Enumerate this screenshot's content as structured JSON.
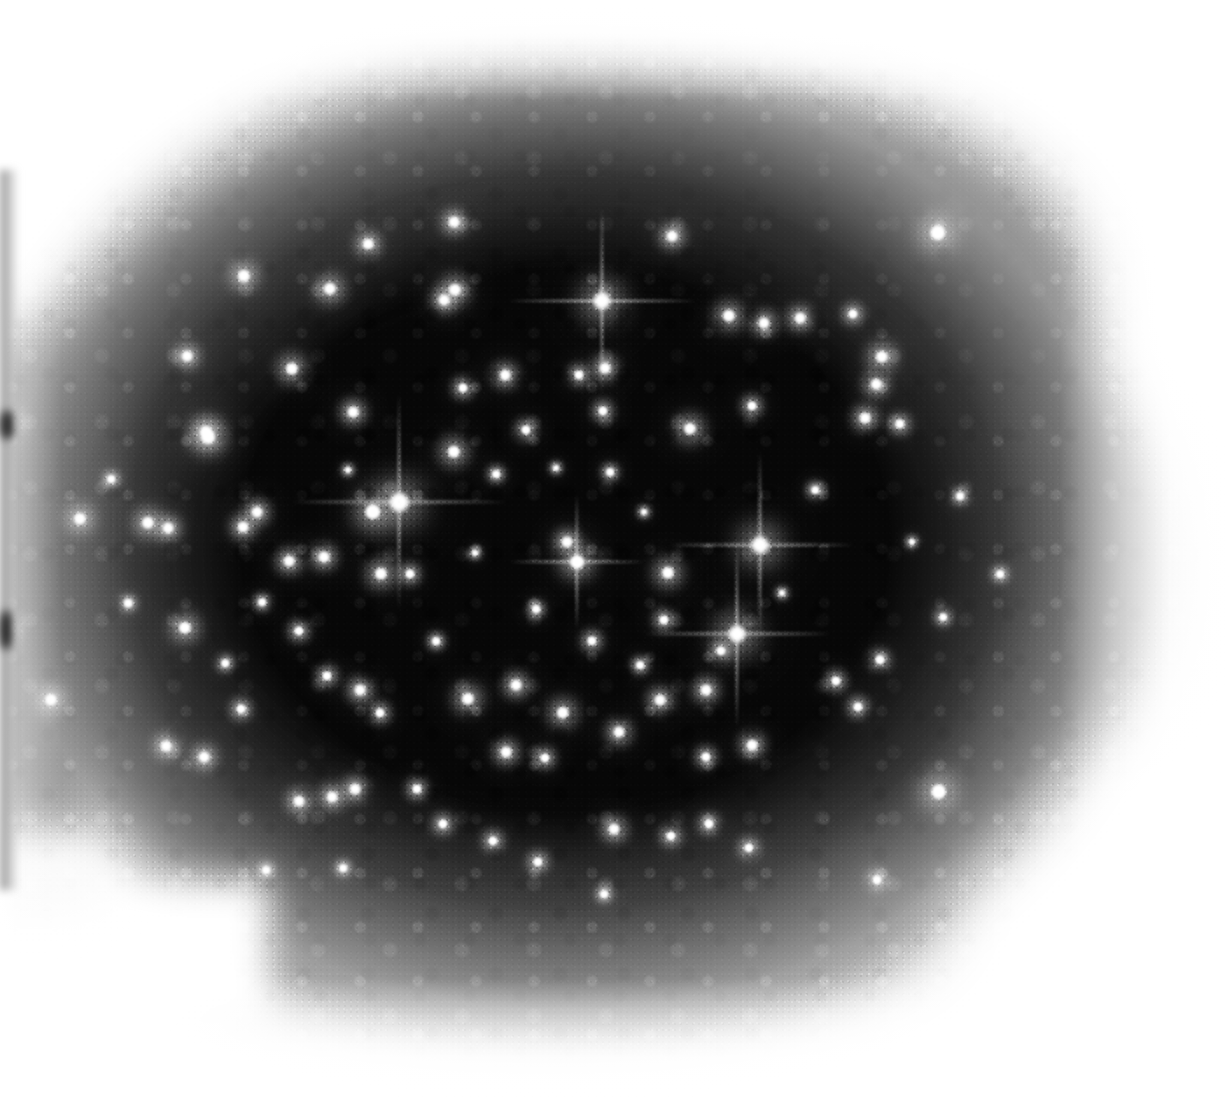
{
  "image": {
    "title": "Photographic plate star field",
    "subject": "open star cluster",
    "medium": "black and white photographic plate scan",
    "orientation": "landscape",
    "width_px": 1232,
    "height_px": 1101
  },
  "colors": {
    "paper": "#ffffff",
    "emulsion_core": "#070707",
    "emulsion_mid": "#1a1a1a",
    "emulsion_edge": "#6e6e6e",
    "star": "#ffffff",
    "left_band": "#787878"
  },
  "plate": {
    "exposed_region_label": "exposed emulsion patch",
    "left": 10,
    "top": 70,
    "right": 1160,
    "bottom": 1030,
    "notch_label": "white corner notch",
    "notch": {
      "left": 40,
      "top": 880,
      "width": 230,
      "height": 150
    },
    "left_band_label": "scan edge band"
  },
  "chart_data": {
    "type": "scatter",
    "title": "Photographic plate star field",
    "xlabel": "plate x (px)",
    "ylabel": "plate y (px)",
    "xlim": [
      0,
      1232
    ],
    "ylim": [
      0,
      1101
    ],
    "grid": false,
    "legend": "none",
    "note": "each point is a stellar image; size = apparent brightness (1 faintest - 10 brightest)",
    "points": [
      {
        "x": 399,
        "y": 502,
        "mag": 10,
        "spikes": true
      },
      {
        "x": 373,
        "y": 512,
        "mag": 8,
        "spikes": false
      },
      {
        "x": 602,
        "y": 301,
        "mag": 9,
        "spikes": true
      },
      {
        "x": 760,
        "y": 545,
        "mag": 9,
        "spikes": true
      },
      {
        "x": 737,
        "y": 634,
        "mag": 9,
        "spikes": true
      },
      {
        "x": 938,
        "y": 233,
        "mag": 8,
        "spikes": false
      },
      {
        "x": 939,
        "y": 792,
        "mag": 8,
        "spikes": false
      },
      {
        "x": 208,
        "y": 437,
        "mag": 7,
        "spikes": false
      },
      {
        "x": 244,
        "y": 276,
        "mag": 6,
        "spikes": false
      },
      {
        "x": 330,
        "y": 289,
        "mag": 6,
        "spikes": false
      },
      {
        "x": 187,
        "y": 356,
        "mag": 5,
        "spikes": false
      },
      {
        "x": 292,
        "y": 369,
        "mag": 6,
        "spikes": false
      },
      {
        "x": 368,
        "y": 244,
        "mag": 5,
        "spikes": false
      },
      {
        "x": 454,
        "y": 222,
        "mag": 5,
        "spikes": false
      },
      {
        "x": 455,
        "y": 290,
        "mag": 6,
        "spikes": false
      },
      {
        "x": 444,
        "y": 300,
        "mag": 5,
        "spikes": false
      },
      {
        "x": 505,
        "y": 375,
        "mag": 5,
        "spikes": false
      },
      {
        "x": 463,
        "y": 388,
        "mag": 4,
        "spikes": false
      },
      {
        "x": 526,
        "y": 430,
        "mag": 4,
        "spikes": false
      },
      {
        "x": 579,
        "y": 375,
        "mag": 4,
        "spikes": false
      },
      {
        "x": 605,
        "y": 368,
        "mag": 5,
        "spikes": false
      },
      {
        "x": 603,
        "y": 411,
        "mag": 4,
        "spikes": false
      },
      {
        "x": 672,
        "y": 236,
        "mag": 5,
        "spikes": false
      },
      {
        "x": 729,
        "y": 316,
        "mag": 6,
        "spikes": false
      },
      {
        "x": 764,
        "y": 323,
        "mag": 5,
        "spikes": false
      },
      {
        "x": 800,
        "y": 318,
        "mag": 5,
        "spikes": false
      },
      {
        "x": 853,
        "y": 314,
        "mag": 4,
        "spikes": false
      },
      {
        "x": 882,
        "y": 357,
        "mag": 6,
        "spikes": false
      },
      {
        "x": 876,
        "y": 384,
        "mag": 5,
        "spikes": false
      },
      {
        "x": 690,
        "y": 429,
        "mag": 6,
        "spikes": false
      },
      {
        "x": 752,
        "y": 406,
        "mag": 4,
        "spikes": false
      },
      {
        "x": 865,
        "y": 418,
        "mag": 5,
        "spikes": false
      },
      {
        "x": 900,
        "y": 424,
        "mag": 4,
        "spikes": false
      },
      {
        "x": 454,
        "y": 452,
        "mag": 6,
        "spikes": false
      },
      {
        "x": 353,
        "y": 412,
        "mag": 5,
        "spikes": false
      },
      {
        "x": 206,
        "y": 432,
        "mag": 6,
        "spikes": false
      },
      {
        "x": 257,
        "y": 512,
        "mag": 5,
        "spikes": false
      },
      {
        "x": 148,
        "y": 523,
        "mag": 6,
        "spikes": false
      },
      {
        "x": 168,
        "y": 528,
        "mag": 5,
        "spikes": false
      },
      {
        "x": 80,
        "y": 519,
        "mag": 6,
        "spikes": false
      },
      {
        "x": 10,
        "y": 424,
        "mag": 6,
        "spikes": false
      },
      {
        "x": 8,
        "y": 628,
        "mag": 5,
        "spikes": false
      },
      {
        "x": 243,
        "y": 527,
        "mag": 5,
        "spikes": false
      },
      {
        "x": 289,
        "y": 561,
        "mag": 5,
        "spikes": false
      },
      {
        "x": 324,
        "y": 557,
        "mag": 5,
        "spikes": false
      },
      {
        "x": 381,
        "y": 574,
        "mag": 6,
        "spikes": false
      },
      {
        "x": 410,
        "y": 574,
        "mag": 4,
        "spikes": false
      },
      {
        "x": 577,
        "y": 562,
        "mag": 7,
        "spikes": true
      },
      {
        "x": 567,
        "y": 542,
        "mag": 5,
        "spikes": false
      },
      {
        "x": 668,
        "y": 573,
        "mag": 6,
        "spikes": false
      },
      {
        "x": 664,
        "y": 620,
        "mag": 4,
        "spikes": false
      },
      {
        "x": 592,
        "y": 641,
        "mag": 4,
        "spikes": false
      },
      {
        "x": 536,
        "y": 609,
        "mag": 3,
        "spikes": false
      },
      {
        "x": 185,
        "y": 628,
        "mag": 6,
        "spikes": false
      },
      {
        "x": 299,
        "y": 631,
        "mag": 4,
        "spikes": false
      },
      {
        "x": 327,
        "y": 676,
        "mag": 4,
        "spikes": false
      },
      {
        "x": 360,
        "y": 690,
        "mag": 5,
        "spikes": false
      },
      {
        "x": 51,
        "y": 700,
        "mag": 6,
        "spikes": false
      },
      {
        "x": 241,
        "y": 709,
        "mag": 4,
        "spikes": false
      },
      {
        "x": 380,
        "y": 713,
        "mag": 4,
        "spikes": false
      },
      {
        "x": 468,
        "y": 699,
        "mag": 6,
        "spikes": false
      },
      {
        "x": 516,
        "y": 685,
        "mag": 5,
        "spikes": false
      },
      {
        "x": 563,
        "y": 713,
        "mag": 6,
        "spikes": false
      },
      {
        "x": 619,
        "y": 732,
        "mag": 5,
        "spikes": false
      },
      {
        "x": 660,
        "y": 700,
        "mag": 5,
        "spikes": false
      },
      {
        "x": 706,
        "y": 690,
        "mag": 5,
        "spikes": false
      },
      {
        "x": 721,
        "y": 651,
        "mag": 4,
        "spikes": false
      },
      {
        "x": 836,
        "y": 681,
        "mag": 4,
        "spikes": false
      },
      {
        "x": 858,
        "y": 707,
        "mag": 4,
        "spikes": false
      },
      {
        "x": 880,
        "y": 660,
        "mag": 4,
        "spikes": false
      },
      {
        "x": 506,
        "y": 752,
        "mag": 5,
        "spikes": false
      },
      {
        "x": 545,
        "y": 758,
        "mag": 4,
        "spikes": false
      },
      {
        "x": 204,
        "y": 757,
        "mag": 5,
        "spikes": false
      },
      {
        "x": 166,
        "y": 746,
        "mag": 5,
        "spikes": false
      },
      {
        "x": 299,
        "y": 801,
        "mag": 5,
        "spikes": false
      },
      {
        "x": 332,
        "y": 797,
        "mag": 5,
        "spikes": false
      },
      {
        "x": 355,
        "y": 789,
        "mag": 5,
        "spikes": false
      },
      {
        "x": 417,
        "y": 789,
        "mag": 4,
        "spikes": false
      },
      {
        "x": 443,
        "y": 824,
        "mag": 4,
        "spikes": false
      },
      {
        "x": 493,
        "y": 841,
        "mag": 4,
        "spikes": false
      },
      {
        "x": 538,
        "y": 862,
        "mag": 4,
        "spikes": false
      },
      {
        "x": 614,
        "y": 829,
        "mag": 5,
        "spikes": false
      },
      {
        "x": 671,
        "y": 836,
        "mag": 4,
        "spikes": false
      },
      {
        "x": 709,
        "y": 824,
        "mag": 4,
        "spikes": false
      },
      {
        "x": 749,
        "y": 848,
        "mag": 4,
        "spikes": false
      },
      {
        "x": 706,
        "y": 757,
        "mag": 4,
        "spikes": false
      },
      {
        "x": 752,
        "y": 745,
        "mag": 5,
        "spikes": false
      },
      {
        "x": 877,
        "y": 880,
        "mag": 4,
        "spikes": false
      },
      {
        "x": 266,
        "y": 870,
        "mag": 3,
        "spikes": false
      },
      {
        "x": 343,
        "y": 868,
        "mag": 3,
        "spikes": false
      },
      {
        "x": 604,
        "y": 894,
        "mag": 3,
        "spikes": false
      },
      {
        "x": 128,
        "y": 603,
        "mag": 3,
        "spikes": false
      },
      {
        "x": 111,
        "y": 479,
        "mag": 3,
        "spikes": false
      },
      {
        "x": 610,
        "y": 472,
        "mag": 3,
        "spikes": false
      },
      {
        "x": 496,
        "y": 474,
        "mag": 3,
        "spikes": false
      },
      {
        "x": 262,
        "y": 602,
        "mag": 3,
        "spikes": false
      },
      {
        "x": 815,
        "y": 490,
        "mag": 3,
        "spikes": false
      },
      {
        "x": 960,
        "y": 496,
        "mag": 3,
        "spikes": false
      },
      {
        "x": 1000,
        "y": 574,
        "mag": 3,
        "spikes": false
      },
      {
        "x": 943,
        "y": 617,
        "mag": 3,
        "spikes": false
      },
      {
        "x": 225,
        "y": 663,
        "mag": 3,
        "spikes": false
      },
      {
        "x": 436,
        "y": 641,
        "mag": 3,
        "spikes": false
      },
      {
        "x": 782,
        "y": 593,
        "mag": 2,
        "spikes": false
      },
      {
        "x": 640,
        "y": 665,
        "mag": 3,
        "spikes": false
      },
      {
        "x": 475,
        "y": 553,
        "mag": 2,
        "spikes": false
      },
      {
        "x": 348,
        "y": 470,
        "mag": 2,
        "spikes": false
      },
      {
        "x": 556,
        "y": 468,
        "mag": 2,
        "spikes": false
      },
      {
        "x": 644,
        "y": 512,
        "mag": 2,
        "spikes": false
      },
      {
        "x": 912,
        "y": 542,
        "mag": 2,
        "spikes": false
      }
    ]
  }
}
